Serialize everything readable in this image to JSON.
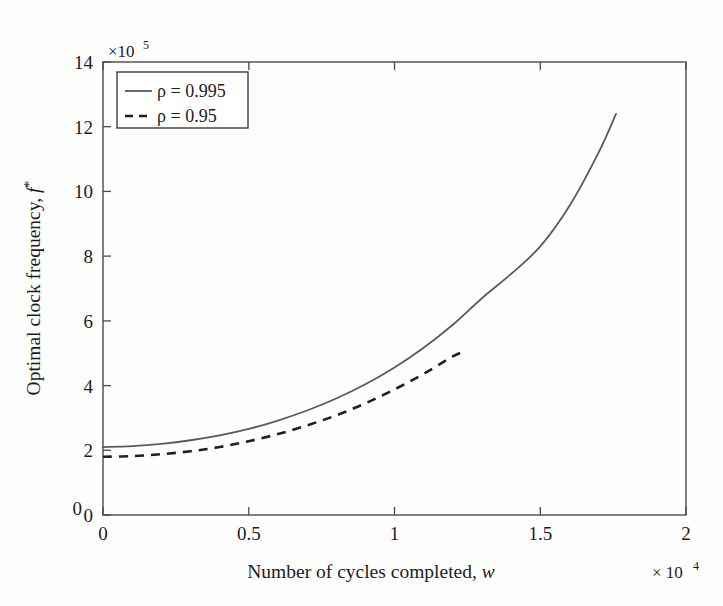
{
  "chart_data": {
    "type": "line",
    "title": "",
    "xlabel": "Number of cycles completed, w",
    "ylabel": "Optimal clock frequency, f*",
    "x_multiplier": "× 10",
    "x_multiplier_exp": "4",
    "y_multiplier": "×10",
    "y_multiplier_exp": "5",
    "xlim": [
      0,
      2
    ],
    "ylim": [
      0,
      14
    ],
    "xticks": [
      "0",
      "0.5",
      "1",
      "1.5",
      "2"
    ],
    "xtick_values": [
      0,
      0.5,
      1,
      1.5,
      2
    ],
    "yticks": [
      "0",
      "2",
      "4",
      "6",
      "8",
      "10",
      "12",
      "14"
    ],
    "ytick_values": [
      0,
      2,
      4,
      6,
      8,
      10,
      12,
      14
    ],
    "grid": false,
    "legend_position": "upper-left",
    "series": [
      {
        "name": "ρ = 0.995",
        "style": "solid",
        "color": "#5a5a5a",
        "x": [
          0.0,
          0.1,
          0.2,
          0.3,
          0.4,
          0.5,
          0.6,
          0.7,
          0.8,
          0.9,
          1.0,
          1.1,
          1.2,
          1.3,
          1.4,
          1.5,
          1.6,
          1.7,
          1.76
        ],
        "y": [
          2.1,
          2.13,
          2.2,
          2.31,
          2.46,
          2.66,
          2.92,
          3.23,
          3.6,
          4.04,
          4.56,
          5.17,
          5.88,
          6.7,
          7.45,
          8.3,
          9.55,
          11.2,
          12.4
        ]
      },
      {
        "name": "ρ = 0.95",
        "style": "dashed",
        "color": "#1f1f1f",
        "x": [
          0.0,
          0.1,
          0.2,
          0.3,
          0.4,
          0.5,
          0.6,
          0.7,
          0.8,
          0.9,
          1.0,
          1.1,
          1.2,
          1.24
        ],
        "y": [
          1.8,
          1.82,
          1.88,
          1.97,
          2.1,
          2.28,
          2.5,
          2.77,
          3.08,
          3.45,
          3.88,
          4.36,
          4.9,
          5.05
        ]
      }
    ]
  },
  "legend": {
    "entries": [
      {
        "label": "ρ = 0.995"
      },
      {
        "label": "ρ = 0.95"
      }
    ]
  },
  "axes": {
    "y_label_text": "Optimal clock frequency, ",
    "y_label_symbol": "f",
    "y_label_sup": "*",
    "x_label_text": "Number of cycles completed, ",
    "x_label_symbol": "w"
  }
}
